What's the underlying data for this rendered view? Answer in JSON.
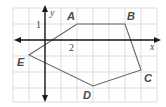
{
  "figure": {
    "type": "coordinate-plane-polygon",
    "axes": {
      "x_label": "x",
      "y_label": "y",
      "x_tick_label": "2",
      "y_tick_label": "1"
    },
    "grid": {
      "cols": 9,
      "rows": 6,
      "unit": 1
    },
    "polygon": {
      "vertices": [
        {
          "label": "A",
          "x": 2,
          "y": 1
        },
        {
          "label": "B",
          "x": 5,
          "y": 1
        },
        {
          "label": "C",
          "x": 6,
          "y": -2
        },
        {
          "label": "D",
          "x": 3,
          "y": -3
        },
        {
          "label": "E",
          "x": -1,
          "y": -1
        }
      ]
    },
    "colors": {
      "grid": "#d4d4d4",
      "axis": "#1a1a1a",
      "polygon": "#666666",
      "labels": "#4a4a4a"
    }
  }
}
